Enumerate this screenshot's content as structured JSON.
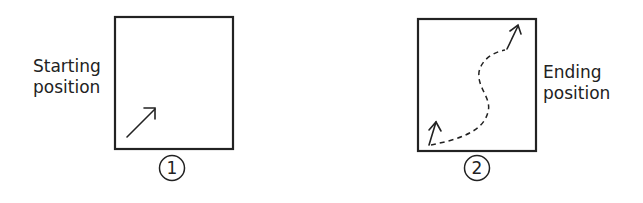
{
  "panels": [
    {
      "number": "1",
      "label_line1": "Starting",
      "label_line2": "position"
    },
    {
      "number": "2",
      "label_line1": "Ending",
      "label_line2": "position"
    }
  ],
  "colors": {
    "stroke": "#222222",
    "background": "#ffffff"
  }
}
